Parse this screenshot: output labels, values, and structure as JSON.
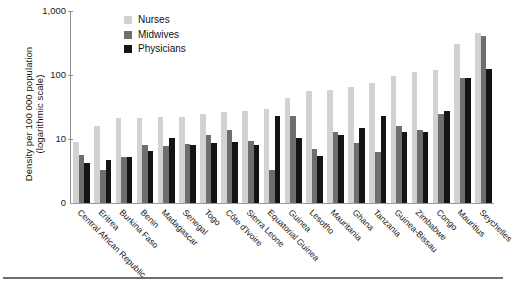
{
  "axis": {
    "y_title_line1": "Density per 100 000 population",
    "y_title_line2": "(logarithmic scale)",
    "y_ticks": [
      "1,000",
      "100",
      "10",
      "0"
    ]
  },
  "legend": {
    "position": "top-left-inside",
    "items": [
      {
        "label": "Nurses",
        "color": "#d2d2d2"
      },
      {
        "label": "Midwives",
        "color": "#6e6e6e"
      },
      {
        "label": "Physicians",
        "color": "#141414"
      }
    ]
  },
  "chart_data": {
    "type": "bar",
    "title": "",
    "xlabel": "",
    "ylabel": "Density per 100 000 population (logarithmic scale)",
    "yscale": "log",
    "ylim": [
      1,
      1000
    ],
    "ytick_values": [
      1000,
      100,
      10,
      0
    ],
    "ytick_labels": [
      "1,000",
      "100",
      "10",
      "0"
    ],
    "grid": false,
    "legend_position": "upper left",
    "categories": [
      "Central African Republic",
      "Eritrea",
      "Burkina Faso",
      "Benin",
      "Madagascar",
      "Senegal",
      "Togo",
      "Côte d'Ivoire",
      "Sierra Leone",
      "Equatorial Guinea",
      "Guinea",
      "Lesotho",
      "Mauritania",
      "Ghana",
      "Tanzania",
      "Guinea-Bissau",
      "Zimbabwe",
      "Congo",
      "Mauritius",
      "Seychelles"
    ],
    "series": [
      {
        "name": "Nurses",
        "color": "#d2d2d2",
        "values": [
          9,
          16,
          21,
          21,
          22,
          22,
          25,
          26,
          27,
          29,
          43,
          57,
          59,
          66,
          76,
          98,
          110,
          120,
          310,
          450
        ]
      },
      {
        "name": "Midwives",
        "color": "#6e6e6e",
        "values": [
          5.6,
          3.3,
          5.3,
          8.2,
          7.7,
          8.3,
          11.5,
          14,
          9.2,
          3.3,
          23,
          7.0,
          13,
          8.7,
          6.3,
          16,
          14,
          25,
          90,
          400
        ]
      },
      {
        "name": "Physicians",
        "color": "#141414",
        "values": [
          4.2,
          4.7,
          5.3,
          6.6,
          10.5,
          8.2,
          8.6,
          9.0,
          8.0,
          23,
          10.5,
          5.5,
          11.5,
          15,
          23,
          13,
          13,
          27,
          90,
          125
        ]
      }
    ]
  }
}
